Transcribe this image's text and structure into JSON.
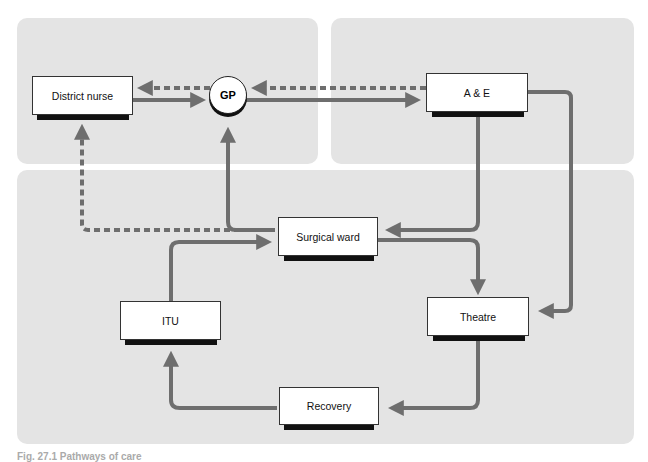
{
  "diagram": {
    "nodes": {
      "district_nurse": "District nurse",
      "gp": "GP",
      "ae": "A & E",
      "surgical_ward": "Surgical ward",
      "itu": "ITU",
      "theatre": "Theatre",
      "recovery": "Recovery"
    },
    "edges": [
      {
        "from": "District nurse",
        "to": "GP",
        "style": "solid"
      },
      {
        "from": "GP",
        "to": "District nurse",
        "style": "dashed"
      },
      {
        "from": "GP",
        "to": "A & E",
        "style": "solid"
      },
      {
        "from": "A & E",
        "to": "GP",
        "style": "dashed"
      },
      {
        "from": "A & E",
        "to": "Surgical ward",
        "style": "solid"
      },
      {
        "from": "A & E",
        "to": "Theatre",
        "style": "solid"
      },
      {
        "from": "Surgical ward",
        "to": "GP",
        "style": "solid"
      },
      {
        "from": "Surgical ward",
        "to": "District nurse",
        "style": "dashed"
      },
      {
        "from": "Surgical ward",
        "to": "Theatre",
        "style": "solid"
      },
      {
        "from": "Theatre",
        "to": "Recovery",
        "style": "solid"
      },
      {
        "from": "Recovery",
        "to": "ITU",
        "style": "solid"
      },
      {
        "from": "ITU",
        "to": "Surgical ward",
        "style": "solid"
      }
    ],
    "colors": {
      "arrow": "#6e6e6e",
      "panel": "#e4e4e4",
      "node_border": "#333333",
      "shadow": "#111111"
    }
  },
  "caption": "Fig. 27.1  Pathways of care"
}
